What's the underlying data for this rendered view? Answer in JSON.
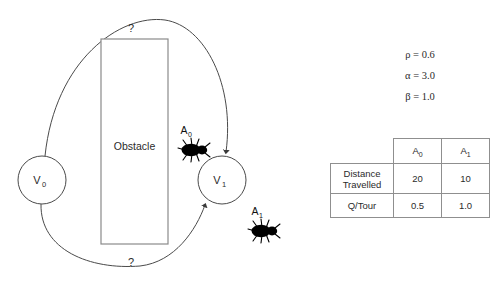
{
  "diagram": {
    "nodes": [
      {
        "id": "v0",
        "label": "V",
        "subscript": "0",
        "cx": 42,
        "cy": 180,
        "r": 24
      },
      {
        "id": "v1",
        "label": "V",
        "subscript": "1",
        "cx": 222,
        "cy": 180,
        "r": 24
      }
    ],
    "obstacle": {
      "label": "Obstacle",
      "x": 101,
      "y": 39,
      "width": 67,
      "height": 205
    },
    "edges": [
      {
        "id": "upper-path",
        "label": "?",
        "label_x": 131,
        "label_y": 32
      },
      {
        "id": "lower-path",
        "label": "?",
        "label_y": 264,
        "label_x": 131
      }
    ],
    "ants": [
      {
        "id": "a0",
        "label": "A",
        "subscript": "0",
        "x": 192,
        "y": 150,
        "label_x": 184,
        "label_y": 131
      },
      {
        "id": "a1",
        "label": "A",
        "subscript": "1",
        "x": 262,
        "y": 231,
        "label_x": 255,
        "label_y": 212
      }
    ]
  },
  "parameters": [
    {
      "symbol": "ρ",
      "value": "0.6",
      "text": "ρ = 0.6"
    },
    {
      "symbol": "α",
      "value": "3.0",
      "text": "α = 3.0"
    },
    {
      "symbol": "β",
      "value": "1.0",
      "text": "β = 1.0"
    }
  ],
  "table": {
    "corner": "",
    "columns": [
      {
        "label": "A",
        "subscript": "0"
      },
      {
        "label": "A",
        "subscript": "1"
      }
    ],
    "rows": [
      {
        "header_line1": "Distance",
        "header_line2": "Travelled",
        "values": [
          "20",
          "10"
        ]
      },
      {
        "header_line1": "Q/Tour",
        "header_line2": "",
        "values": [
          "0.5",
          "1.0"
        ]
      }
    ]
  },
  "colors": {
    "background": "#ffffff",
    "stroke": "#4a4a4a",
    "obstacle_stroke": "#8a8a8a",
    "ant_fill": "#000000",
    "table_border": "#8f8f8f",
    "text": "#2b2b2b"
  }
}
